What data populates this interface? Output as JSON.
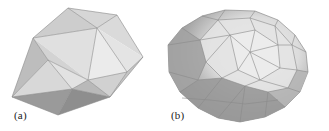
{
  "figure": {
    "panels": [
      {
        "id": "a",
        "label": "(a)",
        "description": "coarse polyhedral mesh"
      },
      {
        "id": "b",
        "label": "(b)",
        "description": "refined ellipsoidal polyhedral mesh"
      }
    ],
    "colors": {
      "background": "#ffffff",
      "face_light": "#e6e6e6",
      "face_mid": "#cfcfcf",
      "face_dark": "#a9a9a9",
      "face_darkest": "#8f8f8f",
      "edge": "#8a8a8a"
    }
  }
}
